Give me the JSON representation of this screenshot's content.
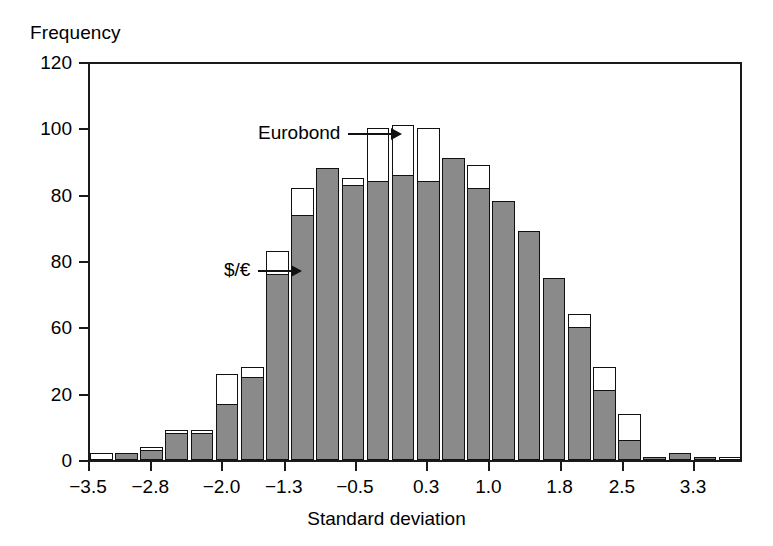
{
  "chart_data": {
    "type": "bar",
    "title": "",
    "ylabel": "Frequency",
    "xlabel": "Standard deviation",
    "grid": false,
    "legend_position": "inline-annotations",
    "ylim": [
      0,
      120
    ],
    "yticks": [
      0,
      20,
      60,
      80,
      80,
      100,
      120
    ],
    "ytick_labels": [
      "0",
      "20",
      "60",
      "80",
      "80",
      "100",
      "120"
    ],
    "xtick_labels": [
      "-3.5",
      "-2.8",
      "-2.0",
      "-1.3",
      "-0.5",
      "0.3",
      "1.0",
      "1.8",
      "2.5",
      "3.3"
    ],
    "xtick_positions": [
      -3.5,
      -2.8,
      -2.0,
      -1.3,
      -0.5,
      0.3,
      1.0,
      1.8,
      2.5,
      3.3
    ],
    "bin_centers": [
      -3.2,
      -2.9,
      -2.6,
      -2.3,
      -2.0,
      -1.7,
      -1.4,
      -1.1,
      -0.8,
      -0.5,
      -0.2,
      0.1,
      0.4,
      0.7,
      1.0,
      1.3,
      1.6,
      1.9,
      2.2,
      2.5,
      2.8,
      3.1,
      3.4,
      3.7
    ],
    "series": [
      {
        "name": "$/€",
        "color": "#8a8a8a",
        "values": [
          0,
          2,
          3,
          8,
          8,
          17,
          25,
          56,
          74,
          88,
          83,
          84,
          86,
          84,
          91,
          82,
          78,
          69,
          55,
          40,
          21,
          6,
          1,
          2,
          1,
          0
        ]
      },
      {
        "name": "Eurobond",
        "color": "#ffffff",
        "values": [
          2,
          2,
          4,
          9,
          9,
          26,
          28,
          63,
          82,
          88,
          85,
          100,
          101,
          100,
          91,
          89,
          78,
          69,
          55,
          44,
          28,
          14,
          1,
          2,
          1,
          1
        ]
      }
    ],
    "annotations": [
      {
        "text": "Eurobond",
        "target_bin": 12
      },
      {
        "text": "$/€",
        "target_bin": 8
      }
    ]
  }
}
